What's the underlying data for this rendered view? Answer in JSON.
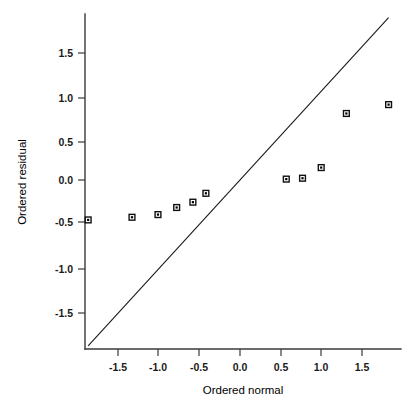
{
  "chart_data": {
    "type": "scatter",
    "title": "",
    "subtitle": "",
    "xlabel": "Ordered normal",
    "ylabel": "Ordered residual",
    "xlim": [
      -2.05,
      2.0
    ],
    "ylim": [
      -1.9,
      1.85
    ],
    "xticks": [
      -1.5,
      -1.0,
      -0.5,
      0.0,
      0.5,
      1.0,
      1.5
    ],
    "yticks": [
      -1.5,
      -1.0,
      -0.5,
      0.0,
      0.5,
      1.0,
      1.5
    ],
    "xticklabels": [
      "-1.5",
      "-1.0",
      "-0.5",
      "0.0",
      "0.5",
      "1.0",
      "1.5"
    ],
    "yticklabels": [
      "-1.5",
      "-1.0",
      "-0.5",
      "0.0",
      "0.5",
      "1.0",
      "1.5"
    ],
    "grid": false,
    "legend": null,
    "legend_position": "none",
    "marker": "filled-square",
    "marker_color": "#111111",
    "series": [
      {
        "name": "Ordered residuals",
        "x": [
          -1.87,
          -1.33,
          -1.01,
          -0.78,
          -0.58,
          -0.42,
          0.57,
          0.77,
          1.0,
          1.31,
          1.83
        ],
        "y": [
          -0.45,
          -0.42,
          -0.39,
          -0.31,
          -0.25,
          -0.15,
          0.01,
          0.02,
          0.14,
          0.75,
          0.85
        ]
      }
    ],
    "reference_line": {
      "name": "identity-line",
      "type": "line",
      "slope": 1.0,
      "intercept": 0.0,
      "color": "#1a1a1a",
      "x_start": -1.87,
      "y_start": -1.87,
      "x_end": 1.83,
      "y_end": 1.83
    }
  },
  "axes": {
    "x_title": "Ordered normal",
    "y_title": "Ordered residual"
  }
}
